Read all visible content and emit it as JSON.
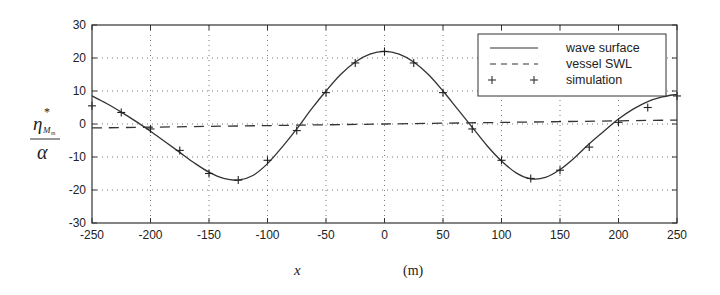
{
  "chart_data": {
    "type": "line",
    "title": "",
    "xlabel": "x",
    "xlabel_unit": "(m)",
    "ylabel": "η*_{M_m} / α",
    "ylabel_numerator": "η",
    "ylabel_sup": "*",
    "ylabel_sub": "M",
    "ylabel_subsub": "m",
    "ylabel_denominator": "α",
    "xlim": [
      -250,
      250
    ],
    "ylim": [
      -30,
      30
    ],
    "xticks": [
      -250,
      -200,
      -150,
      -100,
      -50,
      0,
      50,
      100,
      150,
      200,
      250
    ],
    "yticks": [
      -30,
      -20,
      -10,
      0,
      10,
      20,
      30
    ],
    "grid": "dotted",
    "legend_position": "upper right",
    "legend": [
      {
        "label": "wave surface",
        "style": "solid"
      },
      {
        "label": "vessel SWL",
        "style": "dashed"
      },
      {
        "label": "simulation",
        "style": "plus-markers"
      }
    ],
    "series": [
      {
        "name": "wave surface",
        "style": "solid",
        "x": [
          -250,
          -237.5,
          -225,
          -212.5,
          -200,
          -187.5,
          -175,
          -162.5,
          -150,
          -137.5,
          -125,
          -112.5,
          -100,
          -87.5,
          -75,
          -62.5,
          -50,
          -37.5,
          -25,
          -12.5,
          0,
          12.5,
          25,
          37.5,
          50,
          62.5,
          75,
          87.5,
          100,
          112.5,
          125,
          137.5,
          150,
          162.5,
          175,
          187.5,
          200,
          212.5,
          225,
          237.5,
          250
        ],
        "values": [
          8.5,
          6.2,
          3.6,
          0.8,
          -2.2,
          -5.4,
          -8.6,
          -11.8,
          -14.6,
          -16.5,
          -17.0,
          -15.6,
          -12.0,
          -7.0,
          -1.5,
          4.5,
          10.0,
          15.0,
          18.8,
          21.2,
          22.0,
          21.2,
          18.8,
          15.0,
          10.0,
          4.5,
          -1.0,
          -6.5,
          -11.2,
          -14.8,
          -16.6,
          -16.2,
          -13.8,
          -10.2,
          -6.0,
          -2.2,
          1.5,
          4.5,
          6.8,
          8.2,
          9.0
        ]
      },
      {
        "name": "vessel SWL",
        "style": "dashed",
        "x": [
          -250,
          250
        ],
        "values": [
          -1.2,
          1.2
        ]
      },
      {
        "name": "simulation",
        "style": "plus-markers",
        "x": [
          -250,
          -225,
          -200,
          -175,
          -150,
          -125,
          -100,
          -75,
          -50,
          -25,
          0,
          25,
          50,
          75,
          100,
          125,
          150,
          175,
          200,
          225,
          250
        ],
        "values": [
          5.5,
          3.5,
          -1.5,
          -8.0,
          -15.0,
          -17.0,
          -11.0,
          -2.0,
          9.5,
          18.5,
          22.0,
          18.5,
          9.5,
          -1.5,
          -11.0,
          -16.5,
          -14.0,
          -7.0,
          0.5,
          5.0,
          8.5
        ]
      }
    ]
  }
}
